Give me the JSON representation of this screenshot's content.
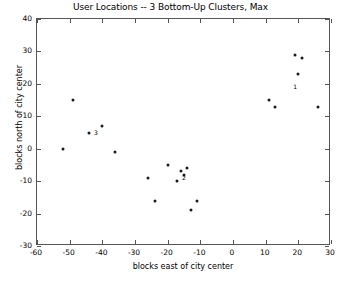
{
  "chart_data": {
    "type": "scatter",
    "title": "User Locations -- 3 Bottom-Up Clusters, Max",
    "xlabel": "blocks east of city center",
    "ylabel": "blocks north of city center",
    "xlim": [
      -60,
      30
    ],
    "ylim": [
      -30,
      40
    ],
    "xticks": [
      -60,
      -50,
      -40,
      -30,
      -20,
      -10,
      0,
      10,
      20,
      30
    ],
    "yticks": [
      -30,
      -20,
      -10,
      0,
      10,
      20,
      30,
      40
    ],
    "xticklabels": [
      "-60",
      "-50",
      "-40",
      "-30",
      "-20",
      "-10",
      "0",
      "10",
      "20",
      "30"
    ],
    "yticklabels": [
      "-30",
      "-20",
      "-10",
      "0",
      "10",
      "20",
      "30",
      "40"
    ],
    "grid": false,
    "legend": false,
    "marker": "point",
    "marker_color": "#1a1a1a",
    "points": [
      {
        "x": -49,
        "y": 15,
        "cluster": 3
      },
      {
        "x": -52,
        "y": 0,
        "cluster": 3
      },
      {
        "x": -44,
        "y": 5,
        "cluster": 3
      },
      {
        "x": -40,
        "y": 7,
        "cluster": 3
      },
      {
        "x": -36,
        "y": -1,
        "cluster": 3
      },
      {
        "x": -26,
        "y": -9,
        "cluster": 2
      },
      {
        "x": -20,
        "y": -5,
        "cluster": 2
      },
      {
        "x": -24,
        "y": -16,
        "cluster": 2
      },
      {
        "x": -17,
        "y": -10,
        "cluster": 2
      },
      {
        "x": -16,
        "y": -7,
        "cluster": 2
      },
      {
        "x": -15,
        "y": -8,
        "cluster": 2
      },
      {
        "x": -14,
        "y": -6,
        "cluster": 2
      },
      {
        "x": -13,
        "y": -19,
        "cluster": 2
      },
      {
        "x": -11,
        "y": -16,
        "cluster": 2
      },
      {
        "x": 11,
        "y": 15,
        "cluster": 1
      },
      {
        "x": 13,
        "y": 13,
        "cluster": 1
      },
      {
        "x": 19,
        "y": 29,
        "cluster": 1
      },
      {
        "x": 21,
        "y": 28,
        "cluster": 1
      },
      {
        "x": 20,
        "y": 23,
        "cluster": 1
      },
      {
        "x": 26,
        "y": 13,
        "cluster": 1
      }
    ],
    "cluster_labels": [
      {
        "text": "3",
        "x": -42,
        "y": 5
      },
      {
        "text": "2",
        "x": -15,
        "y": -9
      },
      {
        "text": "1",
        "x": 19,
        "y": 19
      }
    ]
  },
  "figure": {
    "background_color": "#ffffff",
    "axis_color": "#555555",
    "text_color": "#000000"
  }
}
